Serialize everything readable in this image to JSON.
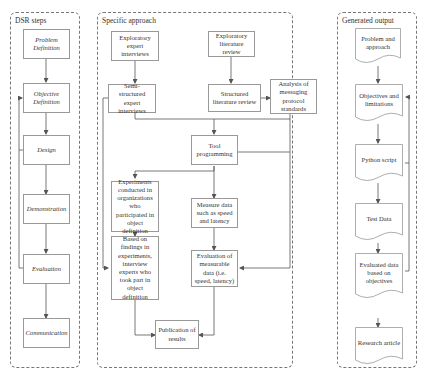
{
  "panels": {
    "dsr": {
      "title": "DSR steps",
      "steps": [
        "Problem Definition",
        "Objective Definition",
        "Design",
        "Demonstration",
        "Evaluation",
        "Communication"
      ]
    },
    "approach": {
      "title": "Specific approach",
      "boxes": {
        "exploratory_interviews": "Exploratory expert interviews",
        "exploratory_literature": "Exploratory literature review",
        "semi_structured": "Semi-structured expert interviews",
        "structured_literature": "Structured literature review",
        "analysis_protocols": "Analysis of messaging protocol standards",
        "tool_programming": "Tool programming",
        "experiments": "Experiments conducted in organizations who participated in object definition",
        "measure_data": "Measure data such as speed and latency",
        "based_on_findings": "Based on findings in experiments, interview experts who took part in object definition",
        "evaluation_measurable": "Evaluation of measurable data (i.e. speed, latency)",
        "publication": "Publication of results"
      }
    },
    "output": {
      "title": "Generated output",
      "documents": [
        "Problem and approach",
        "Objectives and limitations",
        "Python script",
        "Test Data",
        "Evaluated data based on objectives",
        "Research article"
      ]
    }
  },
  "colors": {
    "line": "#555555",
    "box_border": "#999999",
    "panel_border": "#777777"
  }
}
